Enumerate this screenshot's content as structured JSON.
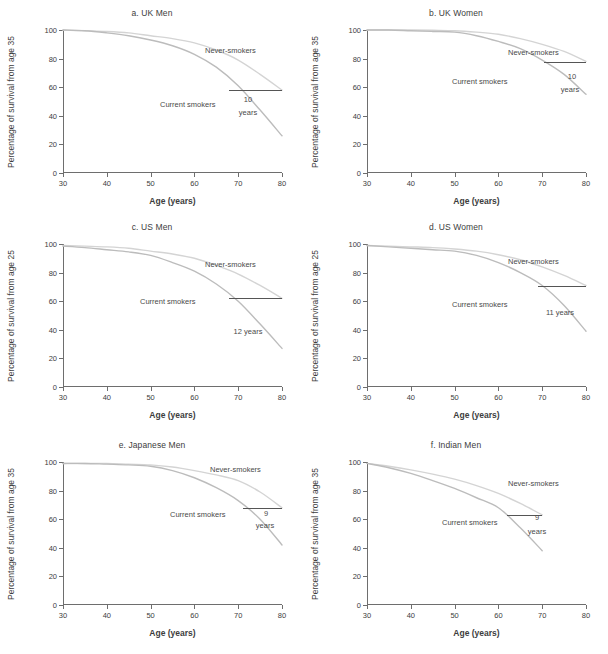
{
  "figure": {
    "width": 608,
    "height": 654,
    "curve_color_never": "#d4d4d4",
    "curve_color_current": "#bcbcbc",
    "gap_line_color": "#555555",
    "axis_color": "#6e6e6e"
  },
  "common": {
    "xlabel": "Age (years)",
    "never_label": "Never-smokers",
    "current_label": "Current smokers",
    "x_ticks": [
      "30",
      "40",
      "50",
      "60",
      "70",
      "80"
    ],
    "y_ticks": [
      "0",
      "20",
      "40",
      "60",
      "80",
      "100"
    ]
  },
  "chart_data": [
    {
      "id": "a",
      "type": "line",
      "title": "a. UK Men",
      "xlabel": "Age (years)",
      "ylabel": "Percentage of survival from age 35",
      "xlim": [
        30,
        80
      ],
      "ylim": [
        0,
        100
      ],
      "xticks": [
        30,
        40,
        50,
        60,
        70,
        80
      ],
      "yticks": [
        0,
        20,
        40,
        60,
        80,
        100
      ],
      "grid": false,
      "legend": "inline-annotation",
      "gap_years": "10",
      "gap_unit": "years",
      "gap_level": 58,
      "gap_x_start": 68,
      "gap_x_end": 80,
      "series": [
        {
          "name": "Never-smokers",
          "x": [
            30,
            35,
            40,
            45,
            50,
            55,
            60,
            65,
            70,
            75,
            80
          ],
          "values": [
            100,
            99.5,
            99,
            98,
            96,
            94,
            91,
            86,
            79,
            69,
            58
          ]
        },
        {
          "name": "Current smokers",
          "x": [
            30,
            35,
            40,
            45,
            50,
            55,
            60,
            65,
            70,
            75,
            80
          ],
          "values": [
            100,
            99.5,
            98,
            96,
            93,
            89,
            83,
            74,
            61,
            44,
            26
          ]
        }
      ]
    },
    {
      "id": "b",
      "type": "line",
      "title": "b. UK Women",
      "xlabel": "Age (years)",
      "ylabel": "Percentage of survival from age 35",
      "xlim": [
        30,
        80
      ],
      "ylim": [
        0,
        100
      ],
      "xticks": [
        30,
        40,
        50,
        60,
        70,
        80
      ],
      "yticks": [
        0,
        20,
        40,
        60,
        80,
        100
      ],
      "grid": false,
      "legend": "inline-annotation",
      "gap_years": "10",
      "gap_unit": "years",
      "gap_level": 78,
      "gap_x_start": 70.5,
      "gap_x_end": 80,
      "series": [
        {
          "name": "Never-smokers",
          "x": [
            30,
            35,
            40,
            45,
            50,
            55,
            60,
            65,
            70,
            75,
            80
          ],
          "values": [
            100,
            100,
            100,
            99.8,
            99.5,
            98.5,
            97,
            94,
            90,
            85,
            78
          ]
        },
        {
          "name": "Current smokers",
          "x": [
            30,
            35,
            40,
            45,
            50,
            55,
            60,
            65,
            70,
            75,
            80
          ],
          "values": [
            100,
            100,
            99.5,
            99,
            98.5,
            96,
            92,
            87,
            79,
            69,
            55
          ]
        }
      ]
    },
    {
      "id": "c",
      "type": "line",
      "title": "c. US Men",
      "xlabel": "Age (years)",
      "ylabel": "Percentage of survival from age 25",
      "xlim": [
        30,
        80
      ],
      "ylim": [
        0,
        100
      ],
      "xticks": [
        30,
        40,
        50,
        60,
        70,
        80
      ],
      "yticks": [
        0,
        20,
        40,
        60,
        80,
        100
      ],
      "grid": false,
      "legend": "inline-annotation",
      "gap_years": "12 years",
      "gap_unit": "",
      "gap_level": 62,
      "gap_x_start": 68,
      "gap_x_end": 80,
      "series": [
        {
          "name": "Never-smokers",
          "x": [
            30,
            35,
            40,
            45,
            50,
            55,
            60,
            65,
            70,
            75,
            80
          ],
          "values": [
            99,
            98.5,
            98,
            97,
            95,
            93,
            90,
            85,
            79,
            71,
            62
          ]
        },
        {
          "name": "Current smokers",
          "x": [
            30,
            35,
            40,
            45,
            50,
            55,
            60,
            65,
            70,
            75,
            80
          ],
          "values": [
            98.5,
            97.5,
            96,
            94.5,
            92,
            87,
            81,
            72,
            60,
            44,
            27
          ]
        }
      ]
    },
    {
      "id": "d",
      "type": "line",
      "title": "d. US Women",
      "xlabel": "Age (years)",
      "ylabel": "Percentage of survival from age 25",
      "xlim": [
        30,
        80
      ],
      "ylim": [
        0,
        100
      ],
      "xticks": [
        30,
        40,
        50,
        60,
        70,
        80
      ],
      "yticks": [
        0,
        20,
        40,
        60,
        80,
        100
      ],
      "grid": false,
      "legend": "inline-annotation",
      "gap_years": "11 years",
      "gap_unit": "",
      "gap_level": 71,
      "gap_x_start": 69,
      "gap_x_end": 80,
      "series": [
        {
          "name": "Never-smokers",
          "x": [
            30,
            35,
            40,
            45,
            50,
            55,
            60,
            65,
            70,
            75,
            80
          ],
          "values": [
            99,
            98.5,
            98,
            97.5,
            96.5,
            95,
            92.5,
            89,
            84,
            78,
            71
          ]
        },
        {
          "name": "Current smokers",
          "x": [
            30,
            35,
            40,
            45,
            50,
            55,
            60,
            65,
            70,
            75,
            80
          ],
          "values": [
            99,
            98,
            97,
            96,
            95,
            92,
            87,
            80,
            71,
            57,
            39
          ]
        }
      ]
    },
    {
      "id": "e",
      "type": "line",
      "title": "e. Japanese Men",
      "xlabel": "Age (years)",
      "ylabel": "Percentage of survival from age 35",
      "xlim": [
        30,
        80
      ],
      "ylim": [
        0,
        100
      ],
      "xticks": [
        30,
        40,
        50,
        60,
        70,
        80
      ],
      "yticks": [
        0,
        20,
        40,
        60,
        80,
        100
      ],
      "grid": false,
      "legend": "inline-annotation",
      "gap_years": "9",
      "gap_unit": "years",
      "gap_level": 68,
      "gap_x_start": 71,
      "gap_x_end": 80,
      "series": [
        {
          "name": "Never-smokers",
          "x": [
            30,
            35,
            40,
            45,
            50,
            55,
            60,
            65,
            70,
            75,
            80
          ],
          "values": [
            99,
            99,
            99,
            98.5,
            98,
            96.5,
            94,
            91,
            87,
            79,
            68
          ]
        },
        {
          "name": "Current smokers",
          "x": [
            30,
            35,
            40,
            45,
            50,
            55,
            60,
            65,
            70,
            75,
            80
          ],
          "values": [
            99,
            99,
            98.5,
            98,
            97,
            94,
            89,
            82,
            73,
            60,
            42
          ]
        }
      ]
    },
    {
      "id": "f",
      "type": "line",
      "title": "f. Indian Men",
      "xlabel": "Age (years)",
      "ylabel": "Percentage of survival from age 35",
      "xlim": [
        30,
        80
      ],
      "ylim": [
        0,
        100
      ],
      "xticks": [
        30,
        40,
        50,
        60,
        70,
        80
      ],
      "yticks": [
        0,
        20,
        40,
        60,
        80,
        100
      ],
      "grid": false,
      "legend": "inline-annotation",
      "gap_years": "9",
      "gap_unit": "years",
      "gap_level": 63,
      "gap_x_start": 62,
      "gap_x_end": 70,
      "series": [
        {
          "name": "Never-smokers",
          "x": [
            30,
            35,
            40,
            45,
            50,
            55,
            60,
            65,
            70
          ],
          "values": [
            99,
            97,
            94.5,
            91.5,
            88,
            83.5,
            78,
            71,
            63
          ]
        },
        {
          "name": "Current smokers",
          "x": [
            30,
            35,
            40,
            45,
            50,
            55,
            60,
            65,
            70
          ],
          "values": [
            99,
            96,
            92,
            87,
            81.5,
            75,
            68,
            54,
            38
          ]
        }
      ]
    }
  ],
  "annotations": {
    "a": {
      "never": {
        "x": 205,
        "y": 46
      },
      "current": {
        "x": 160,
        "y": 100
      },
      "gaptext": {
        "x": 248,
        "y": 95
      },
      "gapunit": {
        "x": 248,
        "y": 108
      }
    },
    "b": {
      "never": {
        "x": 508,
        "y": 48
      },
      "current": {
        "x": 452,
        "y": 77
      },
      "gaptext": {
        "x": 572,
        "y": 72
      },
      "gapunit": {
        "x": 570,
        "y": 85
      }
    },
    "c": {
      "never": {
        "x": 205,
        "y": 260
      },
      "current": {
        "x": 140,
        "y": 297
      },
      "gaptext": {
        "x": 248,
        "y": 327
      },
      "gapunit": null
    },
    "d": {
      "never": {
        "x": 508,
        "y": 257
      },
      "current": {
        "x": 452,
        "y": 300
      },
      "gaptext": {
        "x": 560,
        "y": 308
      },
      "gapunit": null
    },
    "e": {
      "never": {
        "x": 210,
        "y": 465
      },
      "current": {
        "x": 170,
        "y": 510
      },
      "gaptext": {
        "x": 266,
        "y": 509
      },
      "gapunit": {
        "x": 265,
        "y": 521
      }
    },
    "f": {
      "never": {
        "x": 508,
        "y": 479
      },
      "current": {
        "x": 442,
        "y": 518
      },
      "gaptext": {
        "x": 537,
        "y": 513
      },
      "gapunit": {
        "x": 537,
        "y": 527
      }
    }
  }
}
